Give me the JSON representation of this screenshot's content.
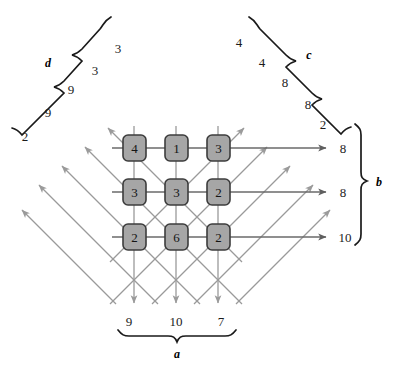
{
  "figure": {
    "grid": {
      "rows": 3,
      "cols": 3,
      "cells": [
        [
          {
            "value": "4"
          },
          {
            "value": "1"
          },
          {
            "value": "3"
          }
        ],
        [
          {
            "value": "3"
          },
          {
            "value": "3"
          },
          {
            "value": "2"
          }
        ],
        [
          {
            "value": "2"
          },
          {
            "value": "6"
          },
          {
            "value": "2"
          }
        ]
      ],
      "cell_fill": "#a6a6a6",
      "cell_stroke": "#3c3c3c"
    },
    "groups": {
      "a": {
        "label": "a",
        "position": "bottom",
        "values": [
          "9",
          "10",
          "7"
        ]
      },
      "b": {
        "label": "b",
        "position": "right",
        "values": [
          "8",
          "8",
          "10"
        ]
      },
      "c": {
        "label": "c",
        "position": "top-right",
        "values": [
          "4",
          "4",
          "8",
          "8",
          "2"
        ]
      },
      "d": {
        "label": "d",
        "position": "top-left",
        "values": [
          "3",
          "3",
          "9",
          "9",
          "2"
        ]
      }
    },
    "arrow_color": "#9a9a9a",
    "row_arrow_color": "#6a6a6a",
    "brace_color": "#1a1a1a"
  }
}
